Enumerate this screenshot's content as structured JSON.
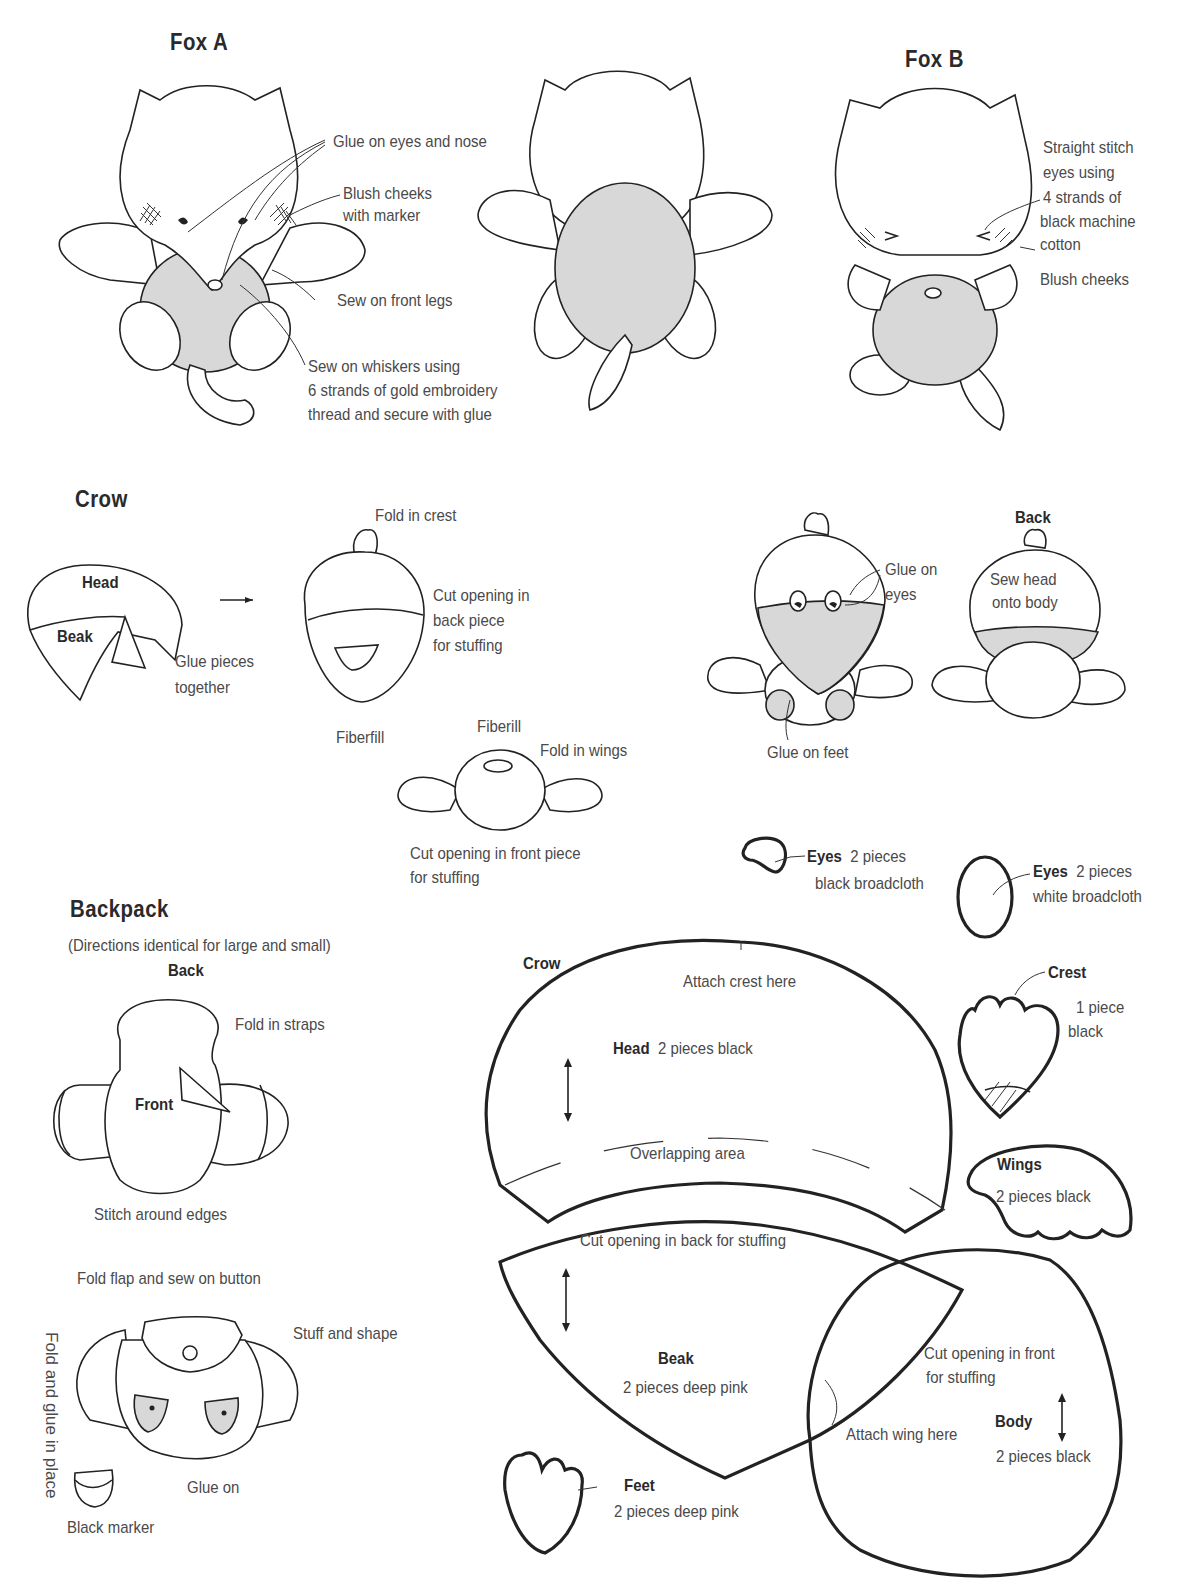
{
  "sections": {
    "fox_a": {
      "title": "Fox A",
      "labels": {
        "glue_eyes": "Glue on eyes and nose",
        "blush_1": "Blush cheeks",
        "blush_2": "with marker",
        "front_legs": "Sew on front legs",
        "whiskers_1": "Sew on whiskers using",
        "whiskers_2": "6 strands of gold embroidery",
        "whiskers_3": "thread and secure with glue"
      }
    },
    "fox_b": {
      "title": "Fox B",
      "labels": {
        "stitch_1": "Straight stitch",
        "stitch_2": "eyes using",
        "stitch_3": "4 strands of",
        "stitch_4": "black machine",
        "stitch_5": "cotton",
        "blush": "Blush cheeks"
      }
    },
    "crow": {
      "title": "Crow",
      "labels": {
        "head": "Head",
        "beak": "Beak",
        "glue_1": "Glue pieces",
        "glue_2": "together",
        "fold_crest": "Fold in crest",
        "cut_back_1": "Cut opening in",
        "cut_back_2": "back piece",
        "cut_back_3": "for stuffing",
        "fiberfill": "Fiberfill",
        "fiberill": "Fiberill",
        "fold_wings": "Fold in wings",
        "cut_front_1": "Cut opening in front piece",
        "cut_front_2": "for stuffing",
        "glue_eyes_1": "Glue on",
        "glue_eyes_2": "eyes",
        "glue_feet": "Glue on feet",
        "back": "Back",
        "sew_head_1": "Sew head",
        "sew_head_2": "onto body"
      }
    },
    "backpack": {
      "title": "Backpack",
      "subtitle": "(Directions identical for large  and small)",
      "labels": {
        "back": "Back",
        "front": "Front",
        "fold_straps": "Fold in straps",
        "stitch_edges": "Stitch around edges",
        "fold_flap": "Fold flap and sew on button",
        "stuff_shape": "Stuff and shape",
        "fold_glue": "Fold and glue in place",
        "glue_on": "Glue on",
        "black_marker": "Black marker"
      }
    },
    "patterns": {
      "crow_label": "Crow",
      "eyes_black": {
        "name": "Eyes",
        "qty": "2 pieces",
        "material": "black broadcloth"
      },
      "eyes_white": {
        "name": "Eyes",
        "qty": "2 pieces",
        "material": "white broadcloth"
      },
      "crest": {
        "name": "Crest",
        "qty": "1 piece",
        "material": "black"
      },
      "head": {
        "name": "Head",
        "desc": "2 pieces black",
        "attach": "Attach crest here",
        "overlap": "Overlapping area"
      },
      "wings": {
        "name": "Wings",
        "desc": "2 pieces black"
      },
      "beak": {
        "name": "Beak",
        "desc": "2 pieces deep pink",
        "cut": "Cut opening in back for stuffing"
      },
      "body": {
        "name": "Body",
        "desc": "2 pieces black",
        "cut_1": "Cut opening in front",
        "cut_2": "for stuffing",
        "attach_wing": "Attach wing here"
      },
      "feet": {
        "name": "Feet",
        "desc": "2 pieces deep pink"
      }
    }
  }
}
